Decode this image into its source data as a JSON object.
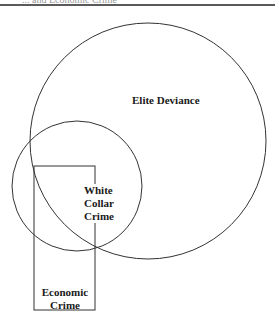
{
  "header": {
    "cut_text": "... and Economic Crime"
  },
  "diagram": {
    "type": "venn",
    "shapes": [
      {
        "id": "elite-deviance",
        "shape": "circle",
        "cx": 148,
        "cy": 141,
        "r": 118
      },
      {
        "id": "white-collar-crime",
        "shape": "circle",
        "cx": 77,
        "cy": 186,
        "r": 65
      },
      {
        "id": "economic-crime",
        "shape": "rectangle",
        "x": 34,
        "y": 166,
        "width": 61,
        "height": 144
      }
    ],
    "labels": {
      "elite": "Elite Deviance",
      "wcc_line1": "White",
      "wcc_line2": "Collar",
      "wcc_line3": "Crime",
      "econ_line1": "Economic",
      "econ_line2": "Crime"
    },
    "stroke_color": "#333333"
  }
}
